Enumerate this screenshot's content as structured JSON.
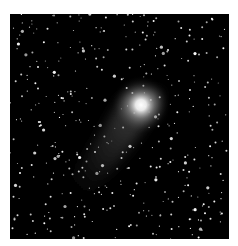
{
  "image": {
    "subject": "comet-in-star-field",
    "background_color": "#000000",
    "page_color": "#ffffff",
    "comet": {
      "nucleus": {
        "x": 131,
        "y": 91
      },
      "coma_radius": 26,
      "tail_end": {
        "x": 62,
        "y": 180
      },
      "color": "#ffffff"
    },
    "star_count": 420,
    "seed": 7
  }
}
